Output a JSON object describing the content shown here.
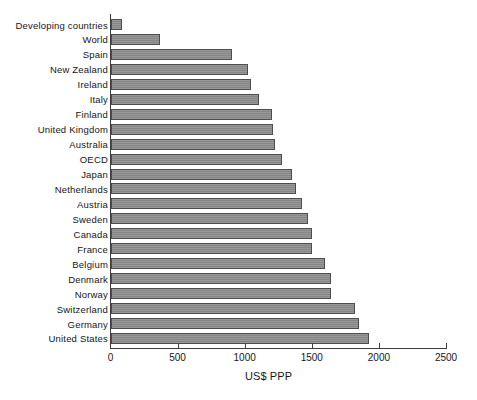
{
  "chart_data": {
    "type": "bar",
    "orientation": "horizontal",
    "title": "",
    "xlabel": "US$ PPP",
    "ylabel": "",
    "xlim": [
      0,
      2500
    ],
    "xticks": [
      0,
      500,
      1000,
      1500,
      2000,
      2500
    ],
    "xtick_labels": [
      "0",
      "500",
      "1000",
      "1500",
      "2000",
      "2500"
    ],
    "grid": false,
    "legend": null,
    "bar_fill_color": "#8c8c8c",
    "bar_edge_color": "#4d4d4d",
    "axis_color": "#3d3d3d",
    "categories": [
      "Developing countries",
      "World",
      "Spain",
      "New Zealand",
      "Ireland",
      "Italy",
      "Finland",
      "United Kingdom",
      "Australia",
      "OECD",
      "Japan",
      "Netherlands",
      "Austria",
      "Sweden",
      "Canada",
      "France",
      "Belgium",
      "Denmark",
      "Norway",
      "Switzerland",
      "Germany",
      "United States"
    ],
    "values": [
      85,
      368,
      903,
      1022,
      1045,
      1104,
      1200,
      1210,
      1225,
      1275,
      1350,
      1380,
      1425,
      1475,
      1505,
      1505,
      1595,
      1640,
      1640,
      1825,
      1850,
      1925
    ]
  }
}
